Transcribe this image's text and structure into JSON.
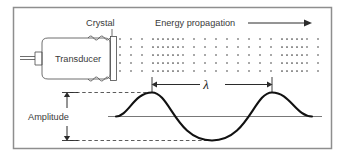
{
  "figure": {
    "background_color": "#ffffff",
    "border_color": "#8e8e8e"
  },
  "labels": {
    "crystal": "Crystal",
    "transducer": "Transducer",
    "energy_propagation": "Energy propagation",
    "wavelength_symbol": "λ",
    "amplitude": "Amplitude"
  },
  "icons": {
    "propagation_arrow": "arrow-right-icon",
    "wavelength_arrow": "double-arrow-horizontal-icon",
    "amplitude_arrow": "double-arrow-vertical-icon"
  },
  "colors": {
    "wave_stroke": "#111111",
    "outline_stroke": "#4a4a4a",
    "dot_fill": "#3d3d3d",
    "dashed_guide": "#4a4a4a",
    "baseline": "#555555"
  },
  "chart_data": {
    "type": "line",
    "xlabel": "",
    "ylabel": "",
    "baseline_y": 117,
    "wave": {
      "description": "One and a half cycles of a sine wave representing pressure amplitude",
      "amplitude_px": 24,
      "wavelength_px": 120,
      "start_x": 118,
      "end_x": 320,
      "peaks_x": [
        152,
        272
      ],
      "trough_x": 212
    },
    "wavelength_marker": {
      "label": "λ",
      "from_x": 152,
      "to_x": 272,
      "y": 84
    },
    "amplitude_marker": {
      "label": "Amplitude",
      "top_y": 92,
      "bottom_y": 140,
      "x": 67
    },
    "particle_field": {
      "description": "Dot matrix showing alternating compression (dense) and rarefaction (sparse) bands",
      "rows_y": [
        39,
        47,
        55,
        63,
        71
      ],
      "x_start": 120,
      "x_end": 322,
      "dense_bands": [
        [
          152,
          182
        ],
        [
          272,
          302
        ]
      ],
      "sparse_spacing_px": 11,
      "dense_spacing_px": 5
    }
  }
}
